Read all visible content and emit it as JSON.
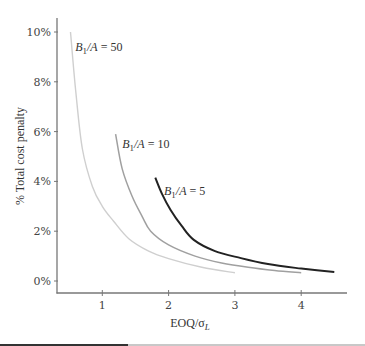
{
  "chart_data": {
    "type": "line",
    "title": "",
    "xlabel": "EOQ/σL",
    "xlabel_main": "EOQ/σ",
    "xlabel_sub": "L",
    "ylabel": "% Total cost penalty",
    "xlim": [
      0.32,
      4.7
    ],
    "ylim": [
      -0.4,
      10.5
    ],
    "x_ticks": [
      1,
      2,
      3,
      4
    ],
    "x_tick_labels": [
      "1",
      "2",
      "3",
      "4"
    ],
    "y_ticks": [
      0,
      2,
      4,
      6,
      8,
      10
    ],
    "y_tick_labels": [
      "0%",
      "2%",
      "4%",
      "6%",
      "8%",
      "10%"
    ],
    "grid": false,
    "legend": "inline labels",
    "series": [
      {
        "name": "B1/A = 50",
        "label_main": "B",
        "label_sub": "1",
        "label_rest": "/A = 50",
        "color": "#cfcfcf",
        "x": [
          0.52,
          0.6,
          0.7,
          0.85,
          1.0,
          1.17,
          1.4,
          1.7,
          2.0,
          2.5,
          3.0
        ],
        "y": [
          10.0,
          7.6,
          5.3,
          3.8,
          3.0,
          2.4,
          1.7,
          1.2,
          0.9,
          0.55,
          0.33
        ]
      },
      {
        "name": "B1/A = 10",
        "label_main": "B",
        "label_sub": "1",
        "label_rest": "/A = 10",
        "color": "#a0a0a0",
        "x": [
          1.2,
          1.3,
          1.45,
          1.6,
          1.73,
          2.0,
          2.4,
          2.8,
          3.2,
          3.6,
          4.0
        ],
        "y": [
          5.9,
          4.5,
          3.4,
          2.6,
          2.0,
          1.45,
          1.0,
          0.72,
          0.55,
          0.42,
          0.33
        ]
      },
      {
        "name": "B1/A = 5",
        "label_main": "B",
        "label_sub": "1",
        "label_rest": "/A = 5",
        "color": "#222222",
        "x": [
          1.8,
          1.9,
          2.03,
          2.2,
          2.38,
          2.7,
          3.09,
          3.5,
          4.0,
          4.5
        ],
        "y": [
          4.15,
          3.5,
          2.85,
          2.2,
          1.65,
          1.2,
          0.92,
          0.68,
          0.5,
          0.36
        ]
      }
    ],
    "label_positions": [
      {
        "x": 0.56,
        "y": 9.4
      },
      {
        "x": 1.27,
        "y": 5.5
      },
      {
        "x": 1.9,
        "y": 3.6
      }
    ]
  }
}
